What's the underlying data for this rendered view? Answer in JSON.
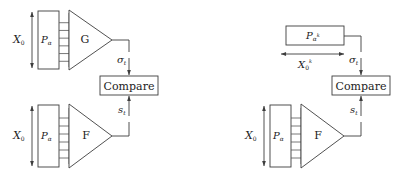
{
  "figure": {
    "canvas": {
      "width": 399,
      "height": 175
    },
    "colors": {
      "background": "#ffffff",
      "stroke": "#3d3d3d",
      "rung": "#555555",
      "text": "#222222"
    }
  },
  "panels": [
    {
      "id": "left-panel",
      "top_branch": {
        "span_label": {
          "base": "X",
          "sub": "0"
        },
        "memory_block": {
          "base": "P",
          "sub": "α"
        },
        "processor_block": {
          "label": "G"
        },
        "output_signal": {
          "base": "σ",
          "sub": "t"
        },
        "rung_count": 5
      },
      "bottom_branch": {
        "span_label": {
          "base": "X",
          "sub": "0"
        },
        "memory_block": {
          "base": "P",
          "sub": "α"
        },
        "processor_block": {
          "label": "F"
        },
        "output_signal": {
          "base": "s",
          "sub": "t"
        },
        "rung_count": 5
      },
      "comparator": {
        "label": "Compare"
      }
    },
    {
      "id": "right-panel",
      "top_branch": {
        "span_label": {
          "base": "X",
          "sub": "0",
          "sup": "k"
        },
        "memory_block": {
          "base": "P",
          "sub": "α",
          "sub_sup": "k"
        },
        "output_signal": {
          "base": "σ",
          "sub": "t"
        }
      },
      "bottom_branch": {
        "span_label": {
          "base": "X",
          "sub": "0"
        },
        "memory_block": {
          "base": "P",
          "sub": "α"
        },
        "processor_block": {
          "label": "F"
        },
        "output_signal": {
          "base": "s",
          "sub": "t"
        },
        "rung_count": 5
      },
      "comparator": {
        "label": "Compare"
      }
    }
  ]
}
